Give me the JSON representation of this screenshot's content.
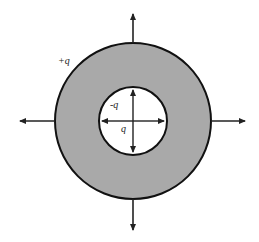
{
  "diagram": {
    "type": "concentric-shell-charge",
    "colors": {
      "shell_fill": "#a9a9a9",
      "inner_fill": "#ffffff",
      "stroke": "#111111",
      "arrow": "#222222"
    },
    "outer_circle": {
      "cx": 133,
      "cy": 121,
      "r": 78
    },
    "inner_circle": {
      "cx": 133,
      "cy": 121,
      "r": 34
    },
    "labels": {
      "outer_charge": "+q",
      "inner_surface_charge": "-q",
      "center_charge": "q"
    },
    "axes": {
      "up_tip": [
        133,
        13
      ],
      "down_tip": [
        133,
        231
      ],
      "left_tip": [
        19,
        121
      ],
      "right_tip": [
        246,
        121
      ]
    }
  }
}
